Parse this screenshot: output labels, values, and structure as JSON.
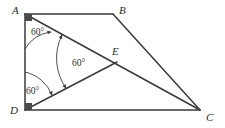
{
  "figure": {
    "stroke_color": "#3a3a3a",
    "marker_color": "#4a4a4a",
    "text_color": "#2b2b2b",
    "background_color": "#ffffff",
    "width": 225,
    "height": 128
  },
  "vertices": [
    {
      "name": "A",
      "label": "A",
      "x": 25,
      "y": 14,
      "label_x": 12,
      "label_y": 5,
      "right_angle": true
    },
    {
      "name": "B",
      "label": "B",
      "x": 113,
      "y": 14,
      "label_x": 119,
      "label_y": 5,
      "right_angle": false
    },
    {
      "name": "C",
      "label": "C",
      "x": 200,
      "y": 110,
      "label_x": 206,
      "label_y": 112,
      "right_angle": false
    },
    {
      "name": "D",
      "label": "D",
      "x": 25,
      "y": 110,
      "label_x": 10,
      "label_y": 105,
      "right_angle": true
    },
    {
      "name": "E",
      "label": "E",
      "x": 117,
      "y": 62,
      "label_x": 112,
      "label_y": 46,
      "right_angle": false
    }
  ],
  "segments": [
    {
      "name": "AB",
      "from": "A",
      "to": "B"
    },
    {
      "name": "BC",
      "from": "B",
      "to": "C"
    },
    {
      "name": "AC",
      "from": "A",
      "to": "C"
    },
    {
      "name": "DC",
      "from": "D",
      "to": "C"
    },
    {
      "name": "AD",
      "from": "A",
      "to": "D"
    },
    {
      "name": "DE",
      "from": "D",
      "to": "E"
    }
  ],
  "angles": [
    {
      "name": "angle-at-a",
      "vertex": "A",
      "value": "60°",
      "label_x": 31,
      "label_y": 28,
      "arc_path": "M 25 49 A 35 35 0 0 1 51 32",
      "arrow_at": "end"
    },
    {
      "name": "angle-at-e",
      "vertex": "E",
      "value": "60°",
      "label_x": 72,
      "label_y": 59,
      "arc_path": "M 62 35 A 52 52 0 0 0 66 88",
      "arrow_at": "both"
    },
    {
      "name": "angle-at-d",
      "vertex": "D",
      "value": "60°",
      "label_x": 26,
      "label_y": 87,
      "arc_path": "M 25 72 A 38 38 0 0 1 52 95",
      "arrow_at": "end"
    }
  ]
}
